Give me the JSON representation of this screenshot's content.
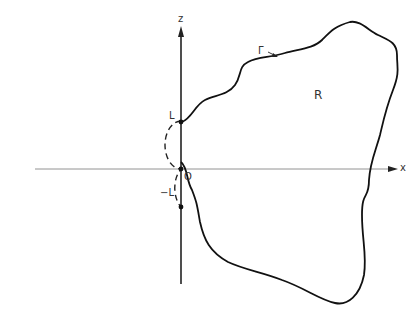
{
  "diagram": {
    "axes": {
      "x_label": "x",
      "z_label": "z",
      "origin_label": "O"
    },
    "points": {
      "upper_label": "L",
      "lower_label": "−L"
    },
    "region_label": "R",
    "boundary_label": "Γ",
    "colors": {
      "stroke": "#111111",
      "axis": "#555555"
    }
  }
}
